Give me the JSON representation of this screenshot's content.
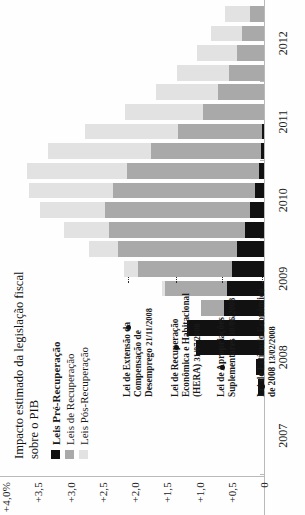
{
  "legend": {
    "title": "Impacto estimado da legislação fiscal sobre o PIB",
    "items": [
      {
        "label": "Leis Pré-Recuperação",
        "color": "#111111",
        "key": "pre"
      },
      {
        "label": "Leis de Recuperação",
        "color": "#a9a9a9",
        "key": "rec"
      },
      {
        "label": "Leis Pós-Recuperação",
        "color": "#e2e2e2",
        "key": "pos"
      }
    ]
  },
  "annotations": [
    {
      "title": "Lei de Extensão da Compensação de Desemprego",
      "date": "21/11/2008"
    },
    {
      "title": "Lei de Recuperação Econômica e Habitacional (HERA)",
      "date": "31/07/2008"
    },
    {
      "title": "Lei de Apropriações Suplementares",
      "date": "30/06/2008"
    },
    {
      "title": "Lei de Estímulo Econômico de 2008",
      "date": "13/02/2008"
    }
  ],
  "chart_data": {
    "type": "bar",
    "title": "Impacto estimado da legislação fiscal sobre o PIB",
    "orientation": "vertical-stacked",
    "xlabel": "",
    "ylabel": "",
    "ylim": [
      0,
      4.0
    ],
    "grid": false,
    "legend_position": "inside-top-left",
    "yticks": [
      "0",
      "+0,5",
      "+1,0",
      "+1,5",
      "+2,0",
      "+2,5",
      "+3,0",
      "+3,5",
      "+4,0%"
    ],
    "ytick_values": [
      0,
      0.5,
      1.0,
      1.5,
      2.0,
      2.5,
      3.0,
      3.5,
      4.0
    ],
    "year_labels": [
      "2007",
      "2008",
      "2009",
      "2010",
      "2011",
      "2012"
    ],
    "categories": [
      "2007 Q1",
      "2007 Q2",
      "2007 Q3",
      "2007 Q4",
      "2008 Q1",
      "2008 Q2",
      "2008 Q3",
      "2008 Q4",
      "2009 Q1",
      "2009 Q2",
      "2009 Q3",
      "2009 Q4",
      "2010 Q1",
      "2010 Q2",
      "2010 Q3",
      "2010 Q4",
      "2011 Q1",
      "2011 Q2",
      "2011 Q3",
      "2011 Q4",
      "2012 Q1",
      "2012 Q2",
      "2012 Q3",
      "2012 Q4"
    ],
    "series": [
      {
        "name": "Leis Pré-Recuperação",
        "key": "pre",
        "color": "#111111",
        "values": [
          0,
          0,
          0,
          0,
          0.1,
          0.12,
          1.05,
          1.2,
          0.62,
          0.58,
          0.5,
          0.42,
          0.3,
          0.22,
          0.14,
          0.08,
          0.05,
          0.03,
          0,
          0,
          0,
          0,
          0,
          0
        ]
      },
      {
        "name": "Leis de Recuperação",
        "key": "rec",
        "color": "#a9a9a9",
        "values": [
          0,
          0,
          0,
          0,
          0,
          0,
          0,
          0,
          0.35,
          0.95,
          1.45,
          1.85,
          2.1,
          2.25,
          2.2,
          2.05,
          1.7,
          1.3,
          0.95,
          0.72,
          0.55,
          0.42,
          0.34,
          0.22
        ]
      },
      {
        "name": "Leis Pós-Recuperação",
        "key": "pos",
        "color": "#e2e2e2",
        "values": [
          0,
          0,
          0,
          0,
          0,
          0,
          0,
          0,
          0,
          0.05,
          0.22,
          0.45,
          0.7,
          1.0,
          1.3,
          1.55,
          1.6,
          1.45,
          1.2,
          0.95,
          0.8,
          0.62,
          0.48,
          0.38
        ]
      }
    ],
    "totals": [
      0,
      0,
      0,
      0,
      0.1,
      0.12,
      1.05,
      1.2,
      0.97,
      1.58,
      2.17,
      2.72,
      3.1,
      3.47,
      3.64,
      3.68,
      3.35,
      2.78,
      2.15,
      1.67,
      1.35,
      1.04,
      0.82,
      0.6
    ]
  }
}
